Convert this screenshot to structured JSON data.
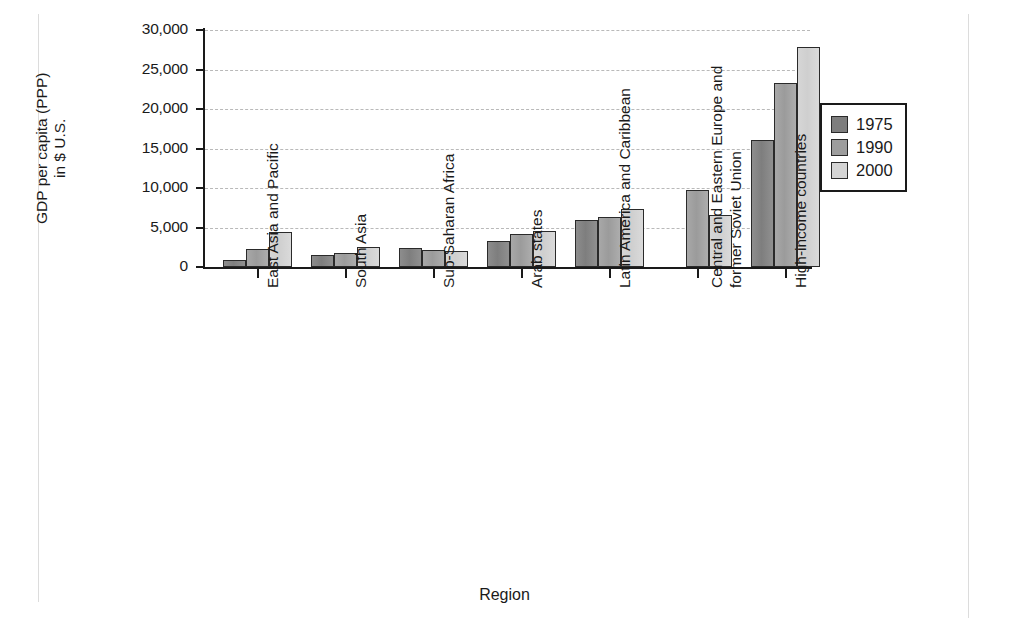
{
  "chart_data": {
    "type": "bar",
    "title": "",
    "xlabel": "Region",
    "ylabel": "GDP per capita (PPP) in $ U.S.",
    "ylabel_lines": [
      "GDP per capita (PPP)",
      "in $ U.S."
    ],
    "ylim": [
      0,
      30000
    ],
    "yticks": [
      0,
      5000,
      10000,
      15000,
      20000,
      25000,
      30000
    ],
    "ytick_labels": [
      "0",
      "5,000",
      "10,000",
      "15,000",
      "20,000",
      "25,000",
      "30,000"
    ],
    "grid": "horizontal-dashed",
    "legend_position": "right",
    "categories": [
      "East Asia and Pacific",
      "South Asia",
      "Sub-Saharan Africa",
      "Arab states",
      "Latin America and Caribbean",
      "Central and Eastern Europe and former Soviet Union",
      "High-income countries"
    ],
    "category_label_lines": [
      [
        "East Asia and Pacific"
      ],
      [
        "South Asia"
      ],
      [
        "Sub-Saharan Africa"
      ],
      [
        "Arab states"
      ],
      [
        "Latin America and Caribbean"
      ],
      [
        "Central and Eastern Europe and",
        "former Soviet Union"
      ],
      [
        "High-income countries"
      ]
    ],
    "series": [
      {
        "name": "1975",
        "color": "#7e7e7e",
        "values": [
          950,
          1500,
          2450,
          3300,
          5900,
          null,
          16100
        ]
      },
      {
        "name": "1990",
        "color": "#9d9d9d",
        "values": [
          2250,
          1800,
          2100,
          4150,
          6300,
          9700,
          23300
        ]
      },
      {
        "name": "2000",
        "color": "#d4d4d4",
        "values": [
          4450,
          2500,
          2050,
          4500,
          7300,
          6600,
          27800
        ]
      }
    ]
  },
  "legend": {
    "entries": [
      {
        "label": "1975"
      },
      {
        "label": "1990"
      },
      {
        "label": "2000"
      }
    ]
  },
  "axes": {
    "x_title": "Region",
    "y_title_line1": "GDP per capita (PPP)",
    "y_title_line2": "in $ U.S."
  }
}
